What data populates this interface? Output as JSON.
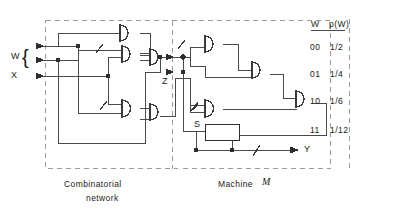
{
  "figure": {
    "type": "logic-circuit-diagram",
    "line_color": "#3f3f3f",
    "dash_color": "#9a9a9a",
    "inputs": [
      {
        "name": "W",
        "label": "W",
        "bits": 2,
        "brace": "{"
      },
      {
        "name": "X",
        "label": "X",
        "bits": 1
      }
    ],
    "internal_signal": {
      "label": "Z"
    },
    "output": {
      "label": "Y"
    },
    "register": {
      "label": "S"
    },
    "regions": [
      {
        "id": "combinatorial",
        "caption_line1": "Combinatorial",
        "caption_line2": "network"
      },
      {
        "id": "machine",
        "caption_line1": "Machine",
        "caption_italic": "M"
      }
    ]
  },
  "table": {
    "headers": [
      "W",
      "p(W)"
    ],
    "rows": [
      [
        "00",
        "1/2"
      ],
      [
        "01",
        "1/4"
      ],
      [
        "10",
        "1/6"
      ],
      [
        "11",
        "1/12"
      ]
    ]
  }
}
